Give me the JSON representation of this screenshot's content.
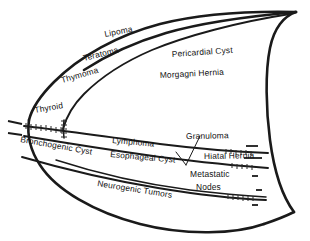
{
  "diagram": {
    "colors": {
      "background": "#ffffff",
      "line": "#1a1a1a",
      "text": "#111111"
    },
    "compartments": {
      "anterior_label": "Anterior Mediastinum",
      "middle_label": "Middle Mediastinum",
      "posterior_label": "Posterior Mediastinum"
    },
    "labels": {
      "lipoma": "Lipoma",
      "teratoma": "Teratoma",
      "thymoma": "Thymoma",
      "thyroid": "Thyroid",
      "pericardial_cyst": "Pericardial Cyst",
      "morgagni_hernia": "Morgagni Hernia",
      "bronchogenic_cyst": "Bronchogenic Cyst",
      "lymphoma": "Lymphoma",
      "esophageal_cyst": "Esophageal Cyst",
      "granuloma": "Granuloma",
      "hiatal_hernia": "Hiatal Hernia",
      "metastatic_nodes_line1": "Metastatic",
      "metastatic_nodes_line2": "Nodes",
      "neurogenic_tumors": "Neurogenic Tumors"
    }
  }
}
